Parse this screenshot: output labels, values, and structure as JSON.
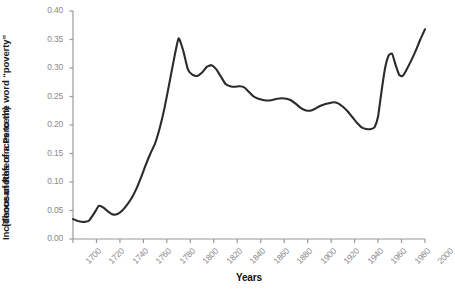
{
  "chart_data": {
    "type": "line",
    "title": "",
    "xlabel": "Years",
    "ylabel": "Incidence of References to the word \"poverty\" (Thousandths of a Percent)",
    "ylabel_line1": "Incidence of References to the word “poverty”",
    "ylabel_line2": "(Thousandths of a Percent)",
    "xlim": [
      1700,
      2000
    ],
    "ylim": [
      0.0,
      0.4
    ],
    "grid": false,
    "legend": "none",
    "line_color": "#2b2b2b",
    "axis_color": "#9a9a9a",
    "tick_label_color": "#8a8a8a",
    "xticks": [
      1700,
      1720,
      1740,
      1760,
      1780,
      1800,
      1820,
      1840,
      1860,
      1880,
      1900,
      1920,
      1940,
      1960,
      1980,
      2000
    ],
    "yticks": [
      "0.00",
      "0.05",
      "0.10",
      "0.15",
      "0.20",
      "0.25",
      "0.30",
      "0.35",
      "0.40"
    ],
    "ytick_values": [
      0.0,
      0.05,
      0.1,
      0.15,
      0.2,
      0.25,
      0.3,
      0.35,
      0.4
    ],
    "series": [
      {
        "name": "poverty",
        "x": [
          1700,
          1705,
          1710,
          1714,
          1718,
          1722,
          1726,
          1730,
          1734,
          1738,
          1742,
          1746,
          1750,
          1754,
          1758,
          1762,
          1766,
          1770,
          1774,
          1778,
          1782,
          1786,
          1790,
          1794,
          1798,
          1802,
          1806,
          1810,
          1814,
          1818,
          1822,
          1826,
          1830,
          1834,
          1838,
          1842,
          1846,
          1850,
          1854,
          1858,
          1862,
          1866,
          1870,
          1874,
          1878,
          1882,
          1886,
          1890,
          1894,
          1898,
          1902,
          1906,
          1910,
          1914,
          1918,
          1922,
          1926,
          1930,
          1934,
          1938,
          1942,
          1946,
          1950,
          1954,
          1957,
          1960,
          1963,
          1966,
          1969,
          1972,
          1975,
          1978,
          1981,
          1984,
          1988,
          1992,
          1996,
          2000
        ],
        "y": [
          0.035,
          0.031,
          0.03,
          0.033,
          0.045,
          0.058,
          0.055,
          0.048,
          0.043,
          0.044,
          0.05,
          0.06,
          0.072,
          0.088,
          0.108,
          0.13,
          0.15,
          0.168,
          0.195,
          0.23,
          0.272,
          0.315,
          0.352,
          0.33,
          0.297,
          0.288,
          0.286,
          0.292,
          0.302,
          0.305,
          0.298,
          0.285,
          0.272,
          0.268,
          0.267,
          0.268,
          0.266,
          0.258,
          0.25,
          0.246,
          0.244,
          0.243,
          0.244,
          0.246,
          0.247,
          0.246,
          0.243,
          0.237,
          0.23,
          0.226,
          0.225,
          0.228,
          0.233,
          0.236,
          0.238,
          0.24,
          0.238,
          0.232,
          0.224,
          0.214,
          0.204,
          0.196,
          0.193,
          0.193,
          0.196,
          0.215,
          0.26,
          0.3,
          0.322,
          0.325,
          0.305,
          0.288,
          0.286,
          0.296,
          0.312,
          0.33,
          0.35,
          0.368
        ]
      }
    ]
  },
  "cropped_text": {
    "top": "",
    "bottom": ""
  }
}
